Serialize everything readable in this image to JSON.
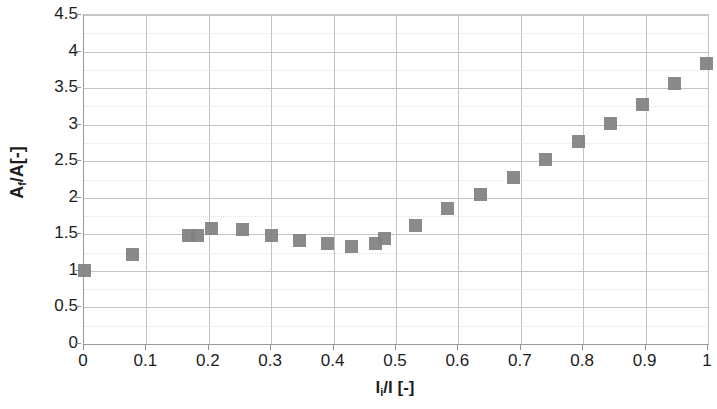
{
  "chart_data": {
    "type": "scatter",
    "title": "",
    "xlabel": "li/l [-]",
    "ylabel": "Af/A[-]",
    "xlabel_base": "l",
    "xlabel_sub": "i",
    "xlabel_rest": "/l [-]",
    "ylabel_base": "A",
    "ylabel_sub": "f",
    "ylabel_rest": "/A[-]",
    "xlim": [
      0,
      1
    ],
    "ylim": [
      0,
      4.5
    ],
    "xticks": [
      "0",
      "0.1",
      "0.2",
      "0.3",
      "0.4",
      "0.5",
      "0.6",
      "0.7",
      "0.8",
      "0.9",
      "1"
    ],
    "xtick_values": [
      0,
      0.1,
      0.2,
      0.3,
      0.4,
      0.5,
      0.6,
      0.7,
      0.8,
      0.9,
      1
    ],
    "yticks": [
      "0",
      "0.5",
      "1",
      "1.5",
      "2",
      "2.5",
      "3",
      "3.5",
      "4",
      "4.5"
    ],
    "ytick_values": [
      0,
      0.5,
      1,
      1.5,
      2,
      2.5,
      3,
      3.5,
      4,
      4.5
    ],
    "y_minor_values": [
      0.25,
      0.75,
      1.25,
      1.75,
      2.25,
      2.75,
      3.25,
      3.75,
      4.25
    ],
    "grid": "major-xy-plus-minor-y",
    "legend": "none",
    "marker_color": "#808080",
    "marker_shape": "square",
    "series": [
      {
        "name": "Af/A vs li/l",
        "points": [
          [
            0.0,
            1.0
          ],
          [
            0.077,
            1.23
          ],
          [
            0.168,
            1.48
          ],
          [
            0.182,
            1.49
          ],
          [
            0.205,
            1.58
          ],
          [
            0.254,
            1.57
          ],
          [
            0.3,
            1.49
          ],
          [
            0.345,
            1.42
          ],
          [
            0.39,
            1.37
          ],
          [
            0.428,
            1.34
          ],
          [
            0.467,
            1.38
          ],
          [
            0.482,
            1.44
          ],
          [
            0.532,
            1.62
          ],
          [
            0.582,
            1.85
          ],
          [
            0.635,
            2.05
          ],
          [
            0.688,
            2.28
          ],
          [
            0.74,
            2.52
          ],
          [
            0.792,
            2.77
          ],
          [
            0.843,
            3.02
          ],
          [
            0.895,
            3.28
          ],
          [
            0.947,
            3.56
          ],
          [
            0.998,
            3.83
          ]
        ]
      }
    ]
  }
}
